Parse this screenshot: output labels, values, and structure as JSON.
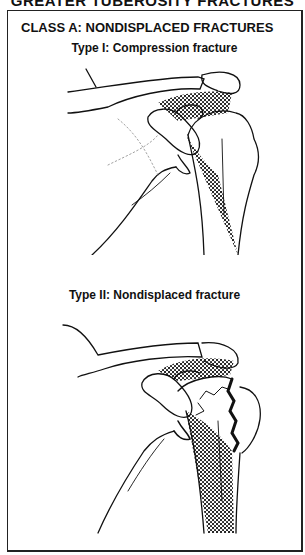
{
  "page": {
    "top_heading": "GREATER TUBEROSITY FRACTURES",
    "class_title": "CLASS A: NONDISPLACED FRACTURES",
    "figures": [
      {
        "caption": "Type I: Compression fracture",
        "subject": "shoulder-illustration-compression-fracture"
      },
      {
        "caption": "Type II: Nondisplaced fracture",
        "subject": "shoulder-illustration-nondisplaced-fracture"
      }
    ]
  }
}
